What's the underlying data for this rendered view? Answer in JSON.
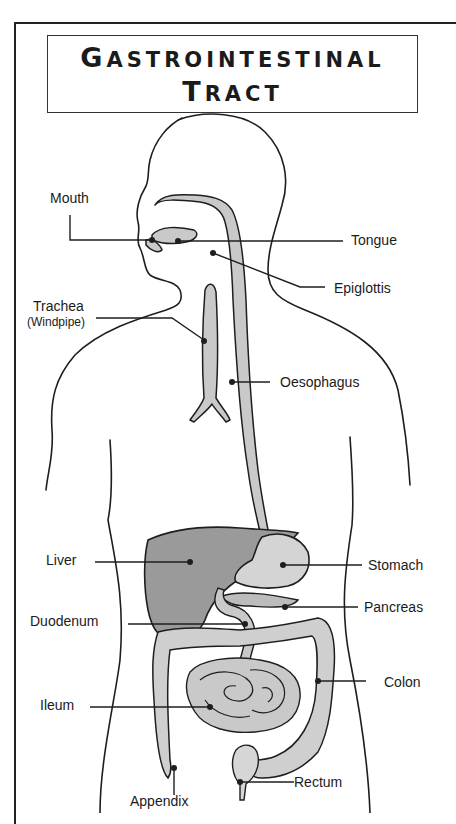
{
  "title": {
    "line1_first": "G",
    "line1_rest": "ASTROINTESTINAL",
    "line2_first": "T",
    "line2_rest": "RACT"
  },
  "labels": {
    "mouth": "Mouth",
    "tongue": "Tongue",
    "epiglottis": "Epiglottis",
    "trachea": "Trachea",
    "windpipe": "(Windpipe)",
    "oesophagus": "Oesophagus",
    "liver": "Liver",
    "stomach": "Stomach",
    "pancreas": "Pancreas",
    "duodenum": "Duodenum",
    "colon": "Colon",
    "ileum": "Ileum",
    "rectum": "Rectum",
    "appendix": "Appendix"
  },
  "colors": {
    "outline": "#1e1e1e",
    "organ_fill": "#c9c9c9",
    "liver_fill": "#9a9a9a",
    "background": "#ffffff"
  }
}
